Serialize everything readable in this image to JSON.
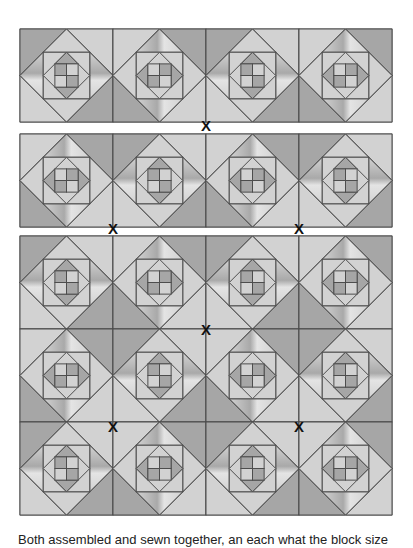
{
  "diagram": {
    "block_size": 93,
    "origin_x": 20,
    "columns": 4,
    "colors": {
      "dark": "#a6a6a6",
      "light": "#d2d2d2",
      "mid": "#bcbcbc",
      "line": "#4d4d4d",
      "marker": "#111111",
      "background": "#ffffff"
    },
    "sections": [
      {
        "top": 29,
        "rows": [
          [
            "A",
            "B",
            "A",
            "B"
          ]
        ]
      },
      {
        "top": 134,
        "rows": [
          [
            "B",
            "A",
            "B",
            "A"
          ]
        ]
      },
      {
        "top": 236,
        "rows": [
          [
            "A",
            "B",
            "A",
            "B"
          ],
          [
            "B",
            "A",
            "B",
            "A"
          ],
          [
            "A",
            "B",
            "A",
            "B"
          ]
        ]
      }
    ],
    "block_types": {
      "A": {
        "dark_corners": [
          "top-left",
          "bottom-right"
        ],
        "inner_dark_points": [
          "top",
          "bottom"
        ],
        "center_dark": [
          "top-left",
          "bottom-right"
        ]
      },
      "B": {
        "dark_corners": [
          "top-right",
          "bottom-left"
        ],
        "inner_dark_points": [
          "left",
          "right"
        ],
        "center_dark": [
          "top-right",
          "bottom-left"
        ]
      }
    },
    "markers": [
      {
        "label": "X",
        "x": 206,
        "y": 125
      },
      {
        "label": "X",
        "x": 113,
        "y": 228
      },
      {
        "label": "X",
        "x": 299,
        "y": 228
      },
      {
        "label": "X",
        "x": 206,
        "y": 329
      },
      {
        "label": "X",
        "x": 113,
        "y": 426
      },
      {
        "label": "X",
        "x": 299,
        "y": 426
      }
    ]
  },
  "caption": "Both assembled and sewn together, an each what the block size"
}
